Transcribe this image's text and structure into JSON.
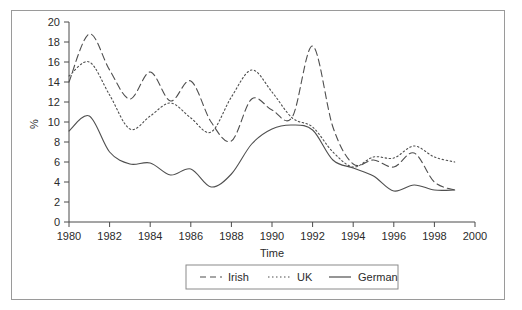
{
  "chart_data": {
    "type": "line",
    "title": "",
    "xlabel": "Time",
    "ylabel": "%",
    "xlim": [
      1980,
      2000
    ],
    "ylim": [
      0,
      20
    ],
    "grid": false,
    "legend_position": "bottom",
    "x_ticks": [
      "1980",
      "1982",
      "1984",
      "1986",
      "1988",
      "1990",
      "1992",
      "1994",
      "1996",
      "1998",
      "2000"
    ],
    "y_ticks": [
      "0",
      "2",
      "4",
      "6",
      "8",
      "10",
      "12",
      "14",
      "16",
      "18",
      "20"
    ],
    "x": [
      1980,
      1981,
      1982,
      1983,
      1984,
      1985,
      1986,
      1987,
      1988,
      1989,
      1990,
      1991,
      1992,
      1993,
      1994,
      1995,
      1996,
      1997,
      1998,
      1999
    ],
    "series": [
      {
        "name": "Irish",
        "style": "dashed",
        "values": [
          14.0,
          18.8,
          15.2,
          12.3,
          15.0,
          12.1,
          14.1,
          10.0,
          8.1,
          12.3,
          11.2,
          10.5,
          17.6,
          9.5,
          5.8,
          6.2,
          5.5,
          6.9,
          4.0,
          3.2
        ]
      },
      {
        "name": "UK",
        "style": "dotted",
        "values": [
          14.6,
          16.0,
          12.7,
          9.3,
          10.6,
          11.9,
          10.4,
          9.0,
          12.5,
          15.2,
          13.0,
          10.4,
          9.5,
          7.0,
          5.5,
          6.5,
          6.4,
          7.6,
          6.5,
          6.0
        ]
      },
      {
        "name": "German",
        "style": "solid",
        "values": [
          9.1,
          10.6,
          7.0,
          5.8,
          5.9,
          4.7,
          5.3,
          3.5,
          4.8,
          7.8,
          9.3,
          9.7,
          9.2,
          6.2,
          5.4,
          4.6,
          3.1,
          3.7,
          3.2,
          3.2
        ]
      }
    ]
  },
  "legend": {
    "items": [
      {
        "label": "Irish"
      },
      {
        "label": "UK"
      },
      {
        "label": "German"
      }
    ]
  },
  "axes": {
    "x_title": "Time",
    "y_title": "%"
  }
}
